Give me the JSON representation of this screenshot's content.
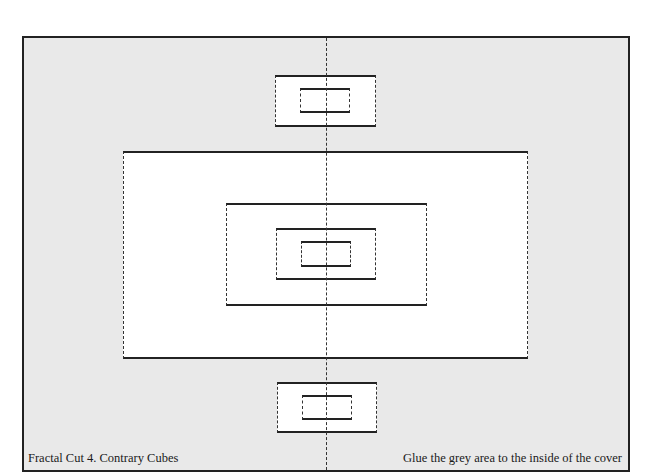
{
  "diagram": {
    "title": "Fractal Cut 4. Contrary Cubes",
    "instruction": "Glue the grey area to the inside of the cover",
    "colors": {
      "background": "#ffffff",
      "glue_area": "#e9e9e9",
      "cut_line": "#222222",
      "fold_line": "#333333"
    },
    "legend": {
      "solid_line": "cut",
      "dashed_line": "fold"
    },
    "shapes": [
      {
        "id": "top-cube-outer",
        "x": 275,
        "y": 75,
        "w": 101,
        "h": 52
      },
      {
        "id": "top-cube-inner",
        "x": 300,
        "y": 88,
        "w": 50,
        "h": 25
      },
      {
        "id": "large-rect",
        "x": 123,
        "y": 151,
        "w": 405,
        "h": 208
      },
      {
        "id": "mid-rect",
        "x": 226,
        "y": 203,
        "w": 201,
        "h": 103
      },
      {
        "id": "small-rect",
        "x": 276,
        "y": 228,
        "w": 100,
        "h": 52
      },
      {
        "id": "tiny-rect",
        "x": 301,
        "y": 241,
        "w": 50,
        "h": 26
      },
      {
        "id": "bottom-cube-outer",
        "x": 277,
        "y": 382,
        "w": 100,
        "h": 51
      },
      {
        "id": "bottom-cube-inner",
        "x": 302,
        "y": 395,
        "w": 50,
        "h": 25
      }
    ],
    "center_fold_x": 326
  }
}
